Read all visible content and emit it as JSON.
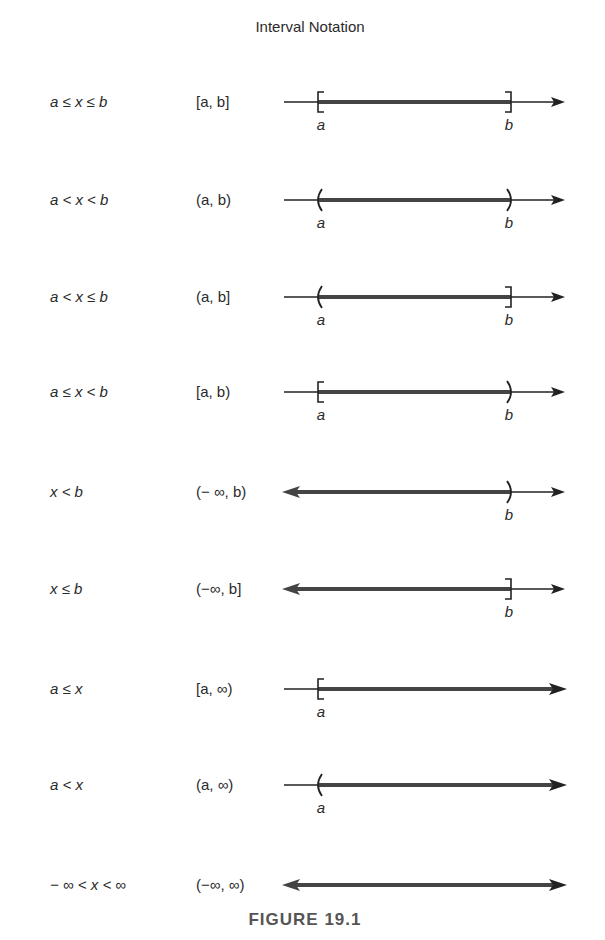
{
  "title": "Interval Notation",
  "caption": "FIGURE 19.1",
  "colors": {
    "ink": "#222222",
    "shade": "#444444",
    "caption": "#555555"
  },
  "rows": [
    {
      "inequality": "a ≤ x ≤ b",
      "notation": "[a, b]",
      "left": {
        "type": "bracket",
        "label": "a"
      },
      "right": {
        "type": "bracket",
        "label": "b"
      }
    },
    {
      "inequality": "a < x < b",
      "notation": "(a, b)",
      "left": {
        "type": "paren",
        "label": "a"
      },
      "right": {
        "type": "paren",
        "label": "b"
      }
    },
    {
      "inequality": "a < x ≤ b",
      "notation": "(a, b]",
      "left": {
        "type": "paren",
        "label": "a"
      },
      "right": {
        "type": "bracket",
        "label": "b"
      }
    },
    {
      "inequality": "a ≤ x < b",
      "notation": "[a, b)",
      "left": {
        "type": "bracket",
        "label": "a"
      },
      "right": {
        "type": "paren",
        "label": "b"
      }
    },
    {
      "inequality": "x < b",
      "notation": "(− ∞, b)",
      "left": {
        "type": "neg-infinity",
        "label": ""
      },
      "right": {
        "type": "paren",
        "label": "b"
      }
    },
    {
      "inequality": "x ≤ b",
      "notation": "(−∞, b]",
      "left": {
        "type": "neg-infinity",
        "label": ""
      },
      "right": {
        "type": "bracket",
        "label": "b"
      }
    },
    {
      "inequality": "a ≤ x",
      "notation": "[a, ∞)",
      "left": {
        "type": "bracket",
        "label": "a"
      },
      "right": {
        "type": "pos-infinity",
        "label": ""
      }
    },
    {
      "inequality": "a < x",
      "notation": "(a, ∞)",
      "left": {
        "type": "paren",
        "label": "a"
      },
      "right": {
        "type": "pos-infinity",
        "label": ""
      }
    },
    {
      "inequality": "− ∞ < x < ∞",
      "notation": "(−∞, ∞)",
      "left": {
        "type": "neg-infinity",
        "label": ""
      },
      "right": {
        "type": "pos-infinity",
        "label": ""
      }
    }
  ]
}
